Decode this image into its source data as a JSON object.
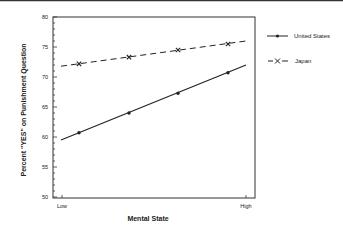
{
  "chart_data": {
    "type": "line",
    "title": "",
    "xlabel": "Mental State",
    "ylabel": "Percent \"YES\" on Punishment Question",
    "x_tick_labels": [
      "Low",
      "High"
    ],
    "y_ticks": [
      50,
      55,
      60,
      65,
      70,
      75,
      80
    ],
    "ylim": [
      50,
      80
    ],
    "grid": false,
    "legend_position": "right",
    "x": [
      1,
      2,
      3,
      4
    ],
    "series": [
      {
        "name": "United States",
        "style": "solid",
        "marker": "dot",
        "values": [
          60.7,
          64.0,
          67.3,
          70.7
        ],
        "fit_line": {
          "start": 59.5,
          "end": 72.0
        }
      },
      {
        "name": "Japan",
        "style": "dashed",
        "marker": "x",
        "values": [
          72.2,
          73.3,
          74.5,
          75.5
        ],
        "fit_line": {
          "start": 71.8,
          "end": 76.0
        }
      }
    ]
  },
  "colors": {
    "line": "#222222",
    "axis": "#333333",
    "background": "#ffffff"
  }
}
